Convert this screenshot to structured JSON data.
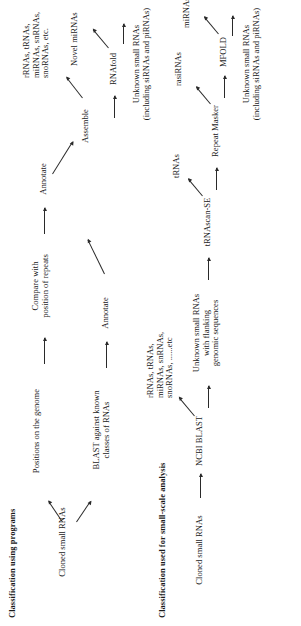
{
  "figure": {
    "orientation": "rotated-90-ccw",
    "background": "#ffffff",
    "ink": "#1a1a1a"
  },
  "panels": [
    {
      "id": "programs",
      "title": "Classification using programs",
      "nodes": {
        "cloned": "Cloned small RNAs",
        "positions": "Positions on the genome",
        "compare": "Compare with\nposition of repeats",
        "annotate_top": "Annotate",
        "annotate_blast": "Annotate",
        "assemble": "Assemble",
        "rna_classes": "rRNAs, tRNAs,\nmiRNAs, snRNAs,\nsnoRNAs, etc.",
        "rnafold": "RNAfold",
        "novel_mirnas": "Novel miRNAs",
        "unknown": "Unknown small RNAs\n(including siRNAs and piRNAs)"
      }
    },
    {
      "id": "small-scale",
      "title": "Classification used for small-scale analysis",
      "nodes": {
        "cloned": "Cloned small RNAs",
        "ncbi_blast": "NCBI BLAST",
        "rna_classes": "rRNAs, tRNAs,\nmiRNAs, snRNAs,\nsnoRNAs, ......etc",
        "unknown_flanking": "Unknown small RNAs\nwith flanking\ngenomic sequences",
        "trnascan": "tRNAscan-SE",
        "trnas": "tRNAs",
        "repeat_masker": "Repeat Masker",
        "rasirnas": "rasiRNAs",
        "mfold": "MFOLD",
        "mirnas": "miRNAs",
        "unknown": "Unknown small RNAs\n(including siRNAs and piRNAs)"
      }
    }
  ],
  "shared": {
    "blast_against": "BLAST against known\nclasses of RNAs"
  }
}
